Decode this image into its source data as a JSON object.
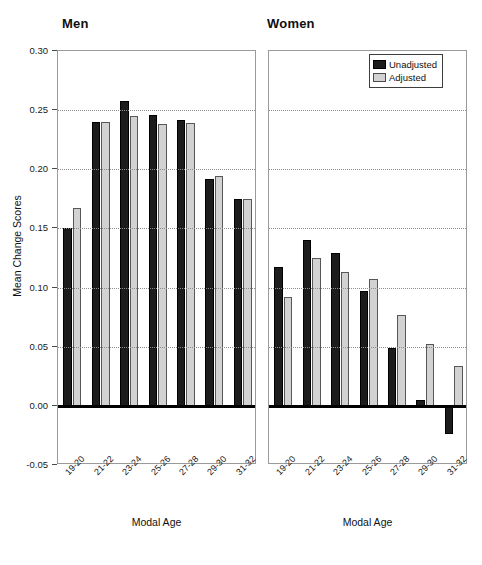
{
  "chart_data": {
    "type": "bar",
    "title": "",
    "xlabel": "Modal Age",
    "ylabel": "Mean Change Scores",
    "ylim": [
      -0.05,
      0.3
    ],
    "ytick_labels": [
      "0.30",
      "0.25",
      "0.20",
      "0.15",
      "0.10",
      "0.05",
      "0.00",
      "-0.05"
    ],
    "ytick_values": [
      0.3,
      0.25,
      0.2,
      0.15,
      0.1,
      0.05,
      0.0,
      -0.05
    ],
    "grid": "horizontal-dotted",
    "legend_position": "top-right of Women panel",
    "categories": [
      "19-20",
      "21-22",
      "23-24",
      "25-26",
      "27-28",
      "29-30",
      "31-32"
    ],
    "panels": [
      {
        "name": "Men",
        "series": [
          {
            "name": "Unadjusted",
            "color": "#1c1c1c",
            "values": [
              0.15,
              0.24,
              0.258,
              0.246,
              0.242,
              0.192,
              0.175
            ]
          },
          {
            "name": "Adjusted",
            "color": "#d2d2d2",
            "values": [
              0.167,
              0.24,
              0.245,
              0.238,
              0.239,
              0.194,
              0.175
            ]
          }
        ]
      },
      {
        "name": "Women",
        "series": [
          {
            "name": "Unadjusted",
            "color": "#1c1c1c",
            "values": [
              0.117,
              0.14,
              0.129,
              0.097,
              0.049,
              0.005,
              -0.024
            ]
          },
          {
            "name": "Adjusted",
            "color": "#d2d2d2",
            "values": [
              0.092,
              0.125,
              0.113,
              0.107,
              0.077,
              0.052,
              0.034
            ]
          }
        ]
      }
    ]
  },
  "legend": {
    "items": [
      {
        "label": "Unadjusted",
        "swatch": "unadj"
      },
      {
        "label": "Adjusted",
        "swatch": "adj"
      }
    ]
  }
}
